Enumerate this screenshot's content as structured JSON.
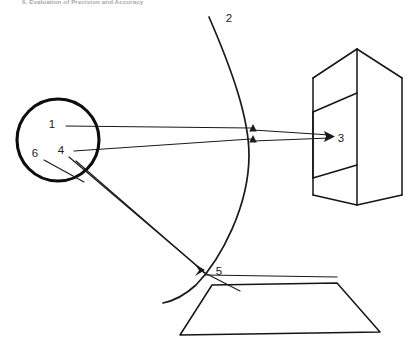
{
  "page": {
    "header_text": "6. Evaluation of Precision and Accuracy",
    "background_color": "#ffffff",
    "ink_color": "#1a1a1a",
    "width": 417,
    "height": 351
  },
  "figure": {
    "title": "",
    "caption": "",
    "callouts": [
      {
        "id": "callout-1",
        "label": "1",
        "x": 52,
        "y": 128,
        "target": "source-circle-interior"
      },
      {
        "id": "callout-2",
        "label": "2",
        "x": 229,
        "y": 22,
        "target": "curved-surface-arc"
      },
      {
        "id": "callout-3",
        "label": "3",
        "x": 341,
        "y": 142,
        "target": "prism-block"
      },
      {
        "id": "callout-4",
        "label": "4",
        "x": 61,
        "y": 154,
        "target": "source-circle-interior"
      },
      {
        "id": "callout-5",
        "label": "5",
        "x": 219,
        "y": 275,
        "target": "arc-plane-intersection"
      },
      {
        "id": "callout-6",
        "label": "6",
        "x": 35,
        "y": 157,
        "target": "source-circle-edge"
      }
    ],
    "elements": {
      "source_circle": {
        "name": "source-circle",
        "cx": 58,
        "cy": 140,
        "r": 41
      },
      "arc": {
        "name": "curved-surface-arc",
        "start_x": 209,
        "start_y": 17,
        "end_x": 163,
        "end_y": 303
      },
      "prism": {
        "name": "prism-block",
        "top_apex_x": 357,
        "top_apex_y": 49,
        "bottom_apex_x": 357,
        "bottom_apex_y": 205
      },
      "ground_plane": {
        "name": "ground-plane-parallelogram",
        "tl_x": 212,
        "tl_y": 285,
        "tr_x": 337,
        "tr_y": 283,
        "br_x": 380,
        "br_y": 332,
        "bl_x": 180,
        "bl_y": 335
      }
    }
  }
}
